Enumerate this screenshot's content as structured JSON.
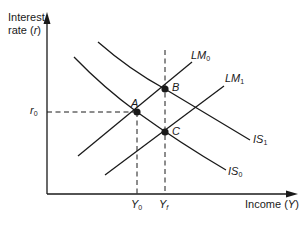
{
  "diagram": {
    "y_axis": {
      "label_line1": "Interest",
      "label_line2_prefix": "rate (",
      "label_var": "r",
      "label_suffix": ")"
    },
    "x_axis": {
      "label_prefix": "Income (",
      "label_var": "Y",
      "label_suffix": ")"
    },
    "ticks": {
      "r0": {
        "base": "r",
        "sub": "0"
      },
      "y0": {
        "base": "Y",
        "sub": "0"
      },
      "yf": {
        "base": "Y",
        "sub": "f"
      }
    },
    "curves": {
      "lm0": {
        "base": "LM",
        "sub": "0"
      },
      "lm1": {
        "base": "LM",
        "sub": "1"
      },
      "is0": {
        "base": "IS",
        "sub": "0"
      },
      "is1": {
        "base": "IS",
        "sub": "1"
      }
    },
    "points": {
      "a": "A",
      "b": "B",
      "c": "C"
    },
    "colors": {
      "line": "#1a1a1a",
      "background": "#ffffff"
    }
  }
}
